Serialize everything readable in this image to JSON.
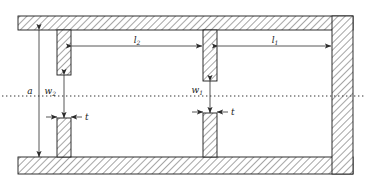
{
  "figure": {
    "kind": "waveguide-filter-cross-section",
    "colors": {
      "outline": "#1a1a1a",
      "hatch": "#555555",
      "fill": "#ffffff",
      "dimension_line": "#3a3a3a",
      "centerline": "#333333"
    }
  },
  "labels": {
    "aperture_height": {
      "base": "a",
      "sub": ""
    },
    "iris_width_1": {
      "base": "w",
      "sub": "1"
    },
    "iris_width_2": {
      "base": "w",
      "sub": "2"
    },
    "cavity_length_1": {
      "base": "l",
      "sub": "1"
    },
    "cavity_length_2": {
      "base": "l",
      "sub": "2"
    },
    "iris_thickness_left": {
      "base": "t",
      "sub": ""
    },
    "iris_thickness_center": {
      "base": "t",
      "sub": ""
    }
  },
  "geometry": {
    "outer": {
      "x": 18,
      "y": 16,
      "width": 335,
      "height": 158
    },
    "wall_thickness_top": 14,
    "wall_thickness_bottom": 17,
    "wall_thickness_right": 21,
    "centerline_y": 96,
    "post_left": {
      "x": 57,
      "width": 14
    },
    "post_center": {
      "x": 203,
      "width": 14
    },
    "gap_left": {
      "top": 75,
      "bottom": 118
    },
    "gap_center": {
      "top": 81,
      "bottom": 113
    }
  }
}
